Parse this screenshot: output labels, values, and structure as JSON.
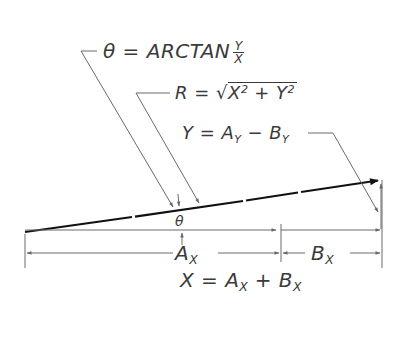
{
  "diagram": {
    "colors": {
      "background": "#ffffff",
      "ink": "#1a1a1a",
      "thin_line": "#6a6a6a",
      "text": "#3a3a3a"
    },
    "labels": {
      "theta_formula": {
        "lhs": "θ",
        "eq": " = ARCTAN",
        "frac_num": "Y",
        "frac_den": "X"
      },
      "r_formula": {
        "lhs": "R = ",
        "radical": "√",
        "x": "X",
        "x_exp": "2",
        "plus": " + ",
        "y": "Y",
        "y_exp": "2"
      },
      "y_formula": {
        "lhs": "Y = A",
        "sub1": "Y",
        "minus": " − B",
        "sub2": "Y"
      },
      "theta_angle": "θ",
      "ax_dim": {
        "base": "A",
        "sub": "X"
      },
      "bx_dim": {
        "base": "B",
        "sub": "X"
      },
      "x_formula": {
        "lhs": "X = A",
        "sub1": "X",
        "plus": " + B",
        "sub2": "X"
      }
    },
    "geometry": {
      "origin": [
        25,
        232
      ],
      "vector_tip": [
        380,
        180
      ],
      "component_split_x": 281,
      "right_x": 381
    }
  }
}
